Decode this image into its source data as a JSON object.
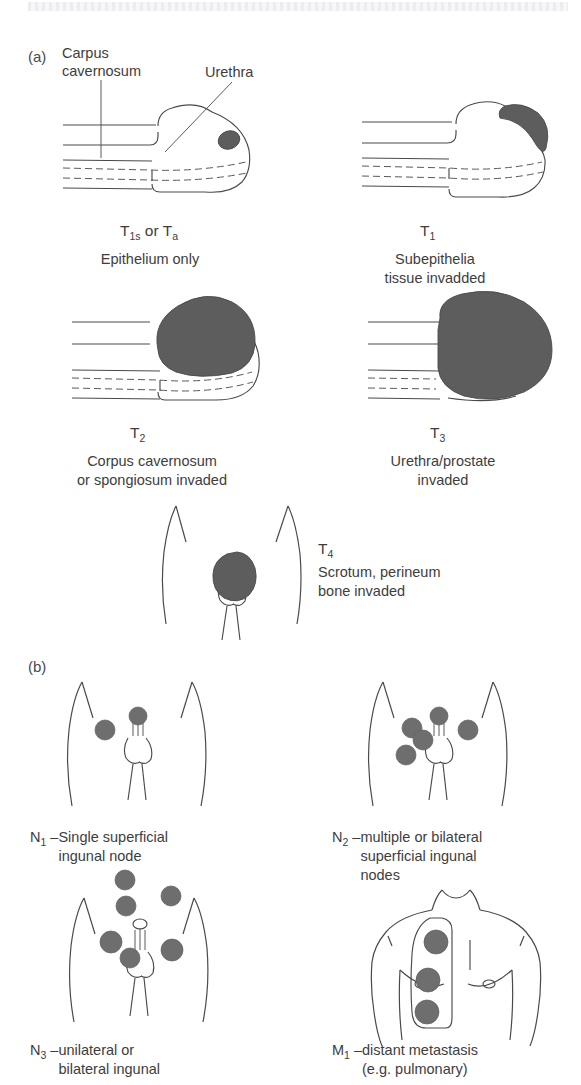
{
  "figure": {
    "title_strip": "",
    "panels": [
      {
        "letter": "(a)",
        "annotations": {
          "corpus_cavernosum": "Carpus\ncavernosum",
          "urethra": "Urethra"
        },
        "stages": [
          {
            "id": "t1s-ta",
            "code_main": "T",
            "code_sub": "1s",
            "code_full": "T1s or Ta",
            "caption": "Epithelium only"
          },
          {
            "id": "t1",
            "code_main": "T",
            "code_sub": "1",
            "code_full": "T1",
            "caption": "Subepithelia\ntissue invadded"
          },
          {
            "id": "t2",
            "code_main": "T",
            "code_sub": "2",
            "code_full": "T2",
            "caption": "Corpus cavernosum\nor spongiosum invaded"
          },
          {
            "id": "t3",
            "code_main": "T",
            "code_sub": "3",
            "code_full": "T3",
            "caption": "Urethra/prostate\ninvaded"
          },
          {
            "id": "t4",
            "code_main": "T",
            "code_sub": "4",
            "code_full": "T4",
            "caption": "Scrotum, perineum\nbone invaded"
          }
        ]
      },
      {
        "letter": "(b)",
        "stages": [
          {
            "id": "n1",
            "code_main": "N",
            "code_sub": "1",
            "dash": " – ",
            "caption": "Single superficial\ningunal node"
          },
          {
            "id": "n2",
            "code_main": "N",
            "code_sub": "2",
            "dash": " – ",
            "caption": "multiple or bilateral\nsuperficial ingunal\nnodes"
          },
          {
            "id": "n3",
            "code_main": "N",
            "code_sub": "3",
            "dash": " – ",
            "caption": "unilateral or\nbilateral ingunal"
          },
          {
            "id": "m1",
            "code_main": "M",
            "code_sub": "1",
            "dash": " – ",
            "caption": "distant metastasis\n(e.g. pulmonary)"
          }
        ]
      }
    ]
  },
  "colors": {
    "tumor_fill": "#5d5d5d",
    "node_fill": "#6e6e6e",
    "line": "#4a4a4a",
    "text": "#3d3d3d",
    "background": "#ffffff"
  }
}
